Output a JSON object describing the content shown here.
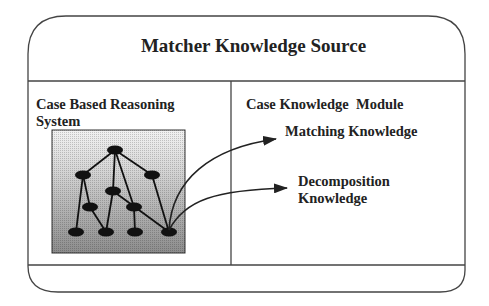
{
  "diagram": {
    "title": "Matcher Knowledge Source",
    "left_panel": {
      "label_line1": "Case Based Reasoning",
      "label_line2": "System",
      "figure": "tree-graph-icon"
    },
    "right_panel": {
      "label": "Case Knowledge  Module",
      "items": [
        {
          "label": "Matching Knowledge"
        },
        {
          "label_line1": "Decomposition",
          "label_line2": "Knowledge"
        }
      ]
    },
    "colors": {
      "stroke": "#333333",
      "node": "#111111",
      "gradient_top": "#f0f0f0",
      "gradient_bottom": "#8a8a8a"
    }
  }
}
